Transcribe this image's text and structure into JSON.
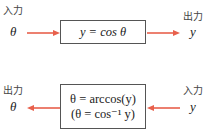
{
  "diagram1": {
    "input_label": "入力",
    "output_label": "出力",
    "input_var": "θ",
    "output_var": "y",
    "equation": "y = cos θ"
  },
  "diagram2": {
    "input_label": "入力",
    "output_label": "出力",
    "input_var": "y",
    "output_var": "θ",
    "equation_line1": "θ = arccos(y)",
    "equation_line2": "(θ = cos⁻¹ y)"
  },
  "colors": {
    "arrow": "#e8604c",
    "box_border": "#555555"
  }
}
